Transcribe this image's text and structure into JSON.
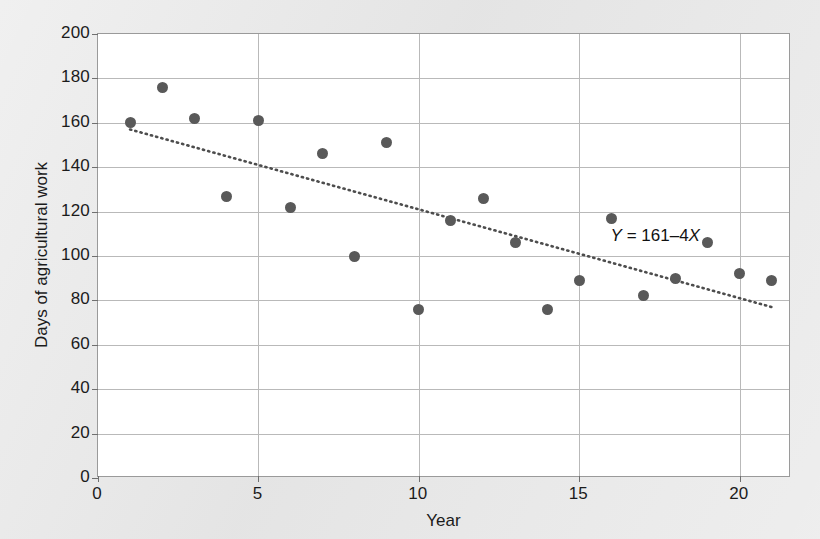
{
  "chart_data": {
    "type": "scatter",
    "title": "",
    "xlabel": "Year",
    "ylabel": "Days of agricultural work",
    "xlim": [
      0,
      21.6
    ],
    "ylim": [
      0,
      200
    ],
    "grid": true,
    "legend": null,
    "xticks": [
      0,
      5,
      10,
      15,
      20
    ],
    "xtick_labels": [
      "0",
      "5",
      "10",
      "15",
      "20"
    ],
    "yticks": [
      0,
      20,
      40,
      60,
      80,
      100,
      120,
      140,
      160,
      180,
      200
    ],
    "ytick_labels": [
      "0",
      "20",
      "40",
      "60",
      "80",
      "100",
      "120",
      "140",
      "160",
      "180",
      "200"
    ],
    "x": [
      1,
      2,
      3,
      4,
      5,
      6,
      7,
      8,
      9,
      10,
      11,
      12,
      13,
      14,
      15,
      16,
      17,
      18,
      19,
      20,
      21
    ],
    "y": [
      160,
      176,
      162,
      127,
      161,
      122,
      146,
      100,
      151,
      76,
      116,
      126,
      106,
      76,
      89,
      117,
      82,
      90,
      106,
      92,
      89
    ],
    "series": [
      {
        "name": "Days of agricultural work",
        "marker": "filled-circle",
        "color": "#595959",
        "values": [
          160,
          176,
          162,
          127,
          161,
          122,
          146,
          100,
          151,
          76,
          116,
          126,
          106,
          76,
          89,
          117,
          82,
          90,
          106,
          92,
          89
        ]
      }
    ],
    "trendline": {
      "style": "dotted",
      "color": "#4d4d4d",
      "equation_text": "Y = 161–4X",
      "equation_parts": {
        "lhs": "Y",
        "eq": " = ",
        "intercept": "161",
        "minus": "–",
        "slope": "4",
        "var": "X"
      },
      "intercept": 161,
      "slope": -4,
      "x_start": 1,
      "x_end": 21
    },
    "annotations": [
      {
        "name": "regression-equation",
        "text": "Y = 161–4X",
        "x": 17.4,
        "y": 108
      }
    ]
  },
  "axes": {
    "y_title": "Days of agricultural work",
    "x_title": "Year"
  },
  "colors": {
    "background": "#e8e8e8",
    "plot_background": "#ffffff",
    "grid": "#b9b9b9",
    "frame": "#9a9a9a",
    "marker": "#595959",
    "trendline": "#4d4d4d",
    "text": "#1b1b1b"
  }
}
